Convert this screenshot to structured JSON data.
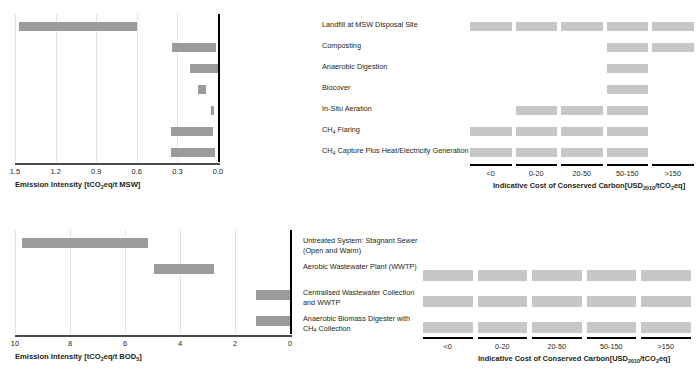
{
  "colors": {
    "bar": "#9b9b9b",
    "cell": "#c7c7c7",
    "axis": "#000000",
    "grid": "#e3e3e3",
    "text": "#231f20"
  },
  "chart_data": [
    {
      "id": "msw-emission-intensity",
      "type": "bar",
      "orientation": "horizontal-reversed",
      "title": "",
      "xlabel": "Emission Intensity [tCO2eq/t MSW]",
      "xlabel_parts": {
        "pre": "Emission Intensity [tCO",
        "sub": "2",
        "post": "eq/t MSW]"
      },
      "ylabel": "",
      "xlim": [
        1.5,
        0.0
      ],
      "ticks": [
        "1.5",
        "1.2",
        "0.9",
        "0.6",
        "0.3",
        "0.0"
      ],
      "tick_values": [
        1.5,
        1.2,
        0.9,
        0.6,
        0.3,
        0.0
      ],
      "grid": true,
      "categories": [
        "Landfill at MSW Disposal Site",
        "Composting",
        "Anaerobic Digestion",
        "Biocover",
        "In-Situ Aeration",
        "CH4 Flaring",
        "CH4 Capture Plus Heat/Electricity Generation"
      ],
      "ranges": [
        [
          1.47,
          0.6
        ],
        [
          0.34,
          0.015
        ],
        [
          0.21,
          0.0
        ],
        [
          0.15,
          0.09
        ],
        [
          0.055,
          0.03
        ],
        [
          0.345,
          0.035
        ],
        [
          0.35,
          0.02
        ]
      ]
    },
    {
      "id": "msw-cost-of-conserved-carbon",
      "type": "heatmap",
      "title": "",
      "xlabel": "Indicative Cost of Conserved Carbon[USD2010/tCO2eq]",
      "xlabel_parts": {
        "pre": "Indicative Cost of Conserved Carbon[USD",
        "sub1": "2010",
        "mid": "/tCO",
        "sub2": "2",
        "post": "eq]"
      },
      "categories": [
        "Landfill at MSW Disposal Site",
        "Composting",
        "Anaerobic Digestion",
        "Biocover",
        "In-Situ Aeration",
        "CH4 Flaring",
        "CH4 Capture Plus Heat/Electricity Generation"
      ],
      "bins": [
        "<0",
        "0-20",
        "20-50",
        "50-150",
        ">150"
      ],
      "cells": [
        [
          1,
          1,
          1,
          1,
          1
        ],
        [
          0,
          0,
          0,
          1,
          1
        ],
        [
          0,
          0,
          0,
          1,
          0
        ],
        [
          0,
          0,
          0,
          1,
          0
        ],
        [
          0,
          1,
          1,
          1,
          0
        ],
        [
          1,
          1,
          1,
          1,
          0
        ],
        [
          1,
          1,
          1,
          1,
          0
        ]
      ]
    },
    {
      "id": "wastewater-emission-intensity",
      "type": "bar",
      "orientation": "horizontal-reversed",
      "title": "",
      "xlabel": "Emission Intensity [tCO2eq/t BOD5]",
      "xlabel_parts": {
        "pre": "Emission Intensity [tCO",
        "sub": "2",
        "post": "eq/t BOD",
        "sub_end": "5",
        "tail": "]"
      },
      "xlim": [
        10,
        0
      ],
      "ticks": [
        "10",
        "8",
        "6",
        "4",
        "2",
        "0"
      ],
      "tick_values": [
        10,
        8,
        6,
        4,
        2,
        0
      ],
      "grid": true,
      "categories": [
        "Untreated System: Stagnant Sewer (Open and Warm)",
        "Aerobic Wastewater Plant (WWTP)",
        "Centralised Wastewater Collection and WWTP",
        "Anaerobic Biomass Digester with CH4 Collection"
      ],
      "ranges": [
        [
          9.75,
          5.15
        ],
        [
          4.95,
          2.75
        ],
        [
          1.25,
          0.0
        ],
        [
          1.25,
          0.0
        ]
      ]
    },
    {
      "id": "wastewater-cost-of-conserved-carbon",
      "type": "heatmap",
      "title": "",
      "xlabel": "Indicative Cost of Conserved Carbon[USD2010/tCO2eq]",
      "xlabel_parts": {
        "pre": "Indicative Cost of Conserved Carbon[USD",
        "sub1": "2010",
        "mid": "/tCO",
        "sub2": "2",
        "post": "eq]"
      },
      "categories": [
        "Untreated System: Stagnant Sewer (Open and Warm)",
        "Aerobic Wastewater Plant (WWTP)",
        "Centralised Wastewater Collection and WWTP",
        "Anaerobic Biomass Digester with CH4 Collection"
      ],
      "bins": [
        "<0",
        "0-20",
        "20-50",
        "50-150",
        ">150"
      ],
      "cells": [
        [
          0,
          0,
          0,
          0,
          0
        ],
        [
          1,
          1,
          1,
          1,
          1
        ],
        [
          1,
          1,
          1,
          1,
          1
        ],
        [
          1,
          1,
          1,
          1,
          1
        ]
      ]
    }
  ],
  "top": {
    "emission": {
      "ticks": [
        "1.5",
        "1.2",
        "0.9",
        "0.6",
        "0.3",
        "0.0"
      ],
      "xlabel_pre": "Emission Intensity [tCO",
      "xlabel_sub": "2",
      "xlabel_post": "eq/t MSW]"
    },
    "categories": [
      {
        "line1": "Landfill at MSW Disposal Site",
        "line2": ""
      },
      {
        "line1": "Composting",
        "line2": ""
      },
      {
        "line1": "Anaerobic Digestion",
        "line2": ""
      },
      {
        "line1": "Biocover",
        "line2": ""
      },
      {
        "line1": "In-Situ Aeration",
        "line2": ""
      },
      {
        "line1_pre": "CH",
        "line1_sub": "4",
        "line1_post": " Flaring"
      },
      {
        "line1_pre": "CH",
        "line1_sub": "4",
        "line1_post": " Capture Plus Heat/Electricity Generation"
      }
    ],
    "cost": {
      "bins": [
        "<0",
        "0-20",
        "20-50",
        "50-150",
        ">150"
      ],
      "xlabel_pre": "Indicative Cost of Conserved Carbon[USD",
      "xlabel_sub1": "2010",
      "xlabel_mid": "/tCO",
      "xlabel_sub2": "2",
      "xlabel_post": "eq]"
    }
  },
  "bottom": {
    "emission": {
      "ticks": [
        "10",
        "8",
        "6",
        "4",
        "2",
        "0"
      ],
      "xlabel_pre": "Emission Intensity [tCO",
      "xlabel_sub": "2",
      "xlabel_mid": "eq/t BOD",
      "xlabel_sub2": "5",
      "xlabel_post": "]"
    },
    "categories": [
      {
        "line1": "Untreated System: Stagnant Sewer",
        "line2": "(Open and Warm)"
      },
      {
        "line1": "Aerobic Wastewater Plant (WWTP)",
        "line2": ""
      },
      {
        "line1": "Centralised Wastewater Collection",
        "line2": "and WWTP"
      },
      {
        "line1_pre": "Anaerobic Biomass Digester with",
        "line2_pre": "CH",
        "line2_sub": "4",
        "line2_post": " Collection"
      }
    ],
    "cost": {
      "bins": [
        "<0",
        "0-20",
        "20-50",
        "50-150",
        ">150"
      ],
      "xlabel_pre": "Indicative Cost of Conserved Carbon[USD",
      "xlabel_sub1": "2010",
      "xlabel_mid": "/tCO",
      "xlabel_sub2": "2",
      "xlabel_post": "eq]"
    }
  }
}
